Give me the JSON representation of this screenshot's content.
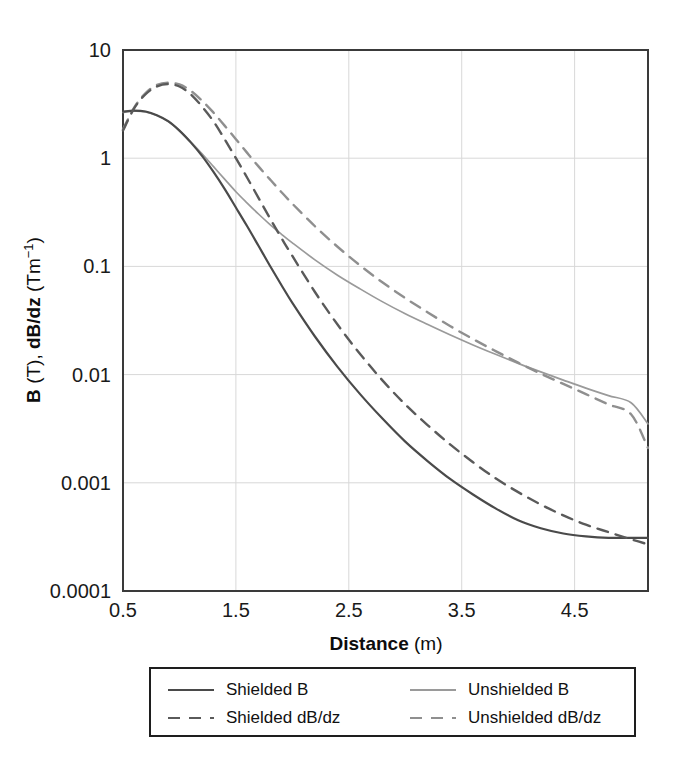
{
  "figure": {
    "background": "#ffffff",
    "plot_frame_color": "#3a3a3a",
    "grid_color": "#d8d8d8"
  },
  "axes": {
    "x": {
      "title_bold": "Distance",
      "title_unit": "(m)",
      "ticks": [
        "0.5",
        "1.5",
        "2.5",
        "3.5",
        "4.5"
      ],
      "tick_values": [
        0.5,
        1.5,
        2.5,
        3.5,
        4.5
      ],
      "min": 0.5,
      "max": 5.15,
      "scale": "linear"
    },
    "y": {
      "title_part1_bold": "B",
      "title_part2": " (T), ",
      "title_part3_bold": "dB/dz",
      "title_part4": " (Tm",
      "title_sup": "−1",
      "title_part5": ")",
      "title_plain": "B (T), dB/dz (Tm−1)",
      "ticks": [
        "10",
        "1",
        "0.1",
        "0.01",
        "0.001",
        "0.0001"
      ],
      "tick_values": [
        10,
        1,
        0.1,
        0.01,
        0.001,
        0.0001
      ],
      "min": 0.0001,
      "max": 10,
      "scale": "log"
    }
  },
  "legend": {
    "position": "below-plot",
    "entries": [
      {
        "label": "Shielded B",
        "color": "#4a4a4a",
        "dash": "solid",
        "width": 2.2
      },
      {
        "label": "Unshielded B",
        "color": "#9a9a9a",
        "dash": "solid",
        "width": 1.8
      },
      {
        "label": "Shielded dB/dz",
        "color": "#5a5a5a",
        "dash": "dashed",
        "width": 2.2
      },
      {
        "label": "Unshielded dB/dz",
        "color": "#8f8f8f",
        "dash": "dashed",
        "width": 2.2
      }
    ]
  },
  "chart_data": {
    "type": "line",
    "title": "",
    "xlabel": "Distance (m)",
    "ylabel": "B (T), dB/dz (Tm−1)",
    "xlim": [
      0.5,
      5.15
    ],
    "ylim": [
      0.0001,
      10
    ],
    "yscale": "log",
    "xscale": "linear",
    "grid": true,
    "legend_position": "below",
    "x": [
      0.5,
      0.6,
      0.7,
      0.8,
      0.9,
      1.0,
      1.1,
      1.2,
      1.3,
      1.4,
      1.5,
      1.6,
      1.7,
      1.8,
      1.9,
      2.0,
      2.2,
      2.4,
      2.6,
      2.8,
      3.0,
      3.2,
      3.4,
      3.6,
      3.8,
      4.0,
      4.2,
      4.4,
      4.6,
      4.8,
      5.0,
      5.15
    ],
    "series": [
      {
        "name": "Shielded B",
        "color": "#4a4a4a",
        "dash": "solid",
        "values": [
          2.7,
          2.75,
          2.7,
          2.5,
          2.2,
          1.8,
          1.4,
          1.05,
          0.75,
          0.52,
          0.35,
          0.235,
          0.155,
          0.102,
          0.068,
          0.046,
          0.0225,
          0.0118,
          0.0066,
          0.0039,
          0.0024,
          0.00158,
          0.00108,
          0.00078,
          0.00058,
          0.00045,
          0.00038,
          0.00034,
          0.00032,
          0.00031,
          0.00031,
          0.00031
        ]
      },
      {
        "name": "Unshielded B",
        "color": "#9a9a9a",
        "dash": "solid",
        "values": [
          2.65,
          2.72,
          2.68,
          2.48,
          2.18,
          1.8,
          1.42,
          1.1,
          0.84,
          0.64,
          0.49,
          0.385,
          0.305,
          0.245,
          0.2,
          0.165,
          0.115,
          0.083,
          0.062,
          0.047,
          0.0365,
          0.029,
          0.0232,
          0.0188,
          0.0154,
          0.0127,
          0.0106,
          0.0089,
          0.0075,
          0.0064,
          0.0055,
          0.0035
        ]
      },
      {
        "name": "Shielded dB/dz",
        "color": "#5a5a5a",
        "dash": "dashed",
        "values": [
          1.8,
          2.9,
          3.9,
          4.6,
          4.85,
          4.6,
          3.9,
          3.0,
          2.2,
          1.5,
          1.0,
          0.66,
          0.43,
          0.28,
          0.185,
          0.125,
          0.058,
          0.029,
          0.0155,
          0.0088,
          0.0053,
          0.0034,
          0.00225,
          0.00155,
          0.0011,
          0.00082,
          0.00063,
          0.0005,
          0.00041,
          0.00035,
          0.0003,
          0.00027
        ]
      },
      {
        "name": "Unshielded dB/dz",
        "color": "#8f8f8f",
        "dash": "dashed",
        "values": [
          1.85,
          2.95,
          4.0,
          4.75,
          5.0,
          4.8,
          4.2,
          3.4,
          2.65,
          2.0,
          1.5,
          1.12,
          0.84,
          0.64,
          0.49,
          0.38,
          0.235,
          0.152,
          0.102,
          0.071,
          0.051,
          0.0375,
          0.028,
          0.0213,
          0.0165,
          0.0129,
          0.0102,
          0.0082,
          0.0066,
          0.0053,
          0.0043,
          0.0021
        ]
      }
    ]
  }
}
